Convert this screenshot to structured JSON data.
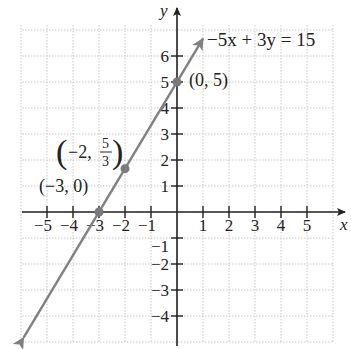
{
  "chart_data": {
    "type": "line",
    "title": "",
    "xlabel": "x",
    "ylabel": "y",
    "xlim": [
      -6,
      6
    ],
    "ylim": [
      -5,
      7
    ],
    "grid": true,
    "x_ticks": [
      -5,
      -4,
      -3,
      -2,
      -1,
      1,
      2,
      3,
      4,
      5
    ],
    "y_ticks": [
      -4,
      -3,
      -2,
      -1,
      1,
      2,
      3,
      4,
      5,
      6
    ],
    "x_tick_labels": [
      "−5",
      "−4",
      "−3",
      "−2",
      "−1",
      "1",
      "2",
      "3",
      "4",
      "5"
    ],
    "y_tick_labels": [
      "−4",
      "−3",
      "−2",
      "−1",
      "1",
      "2",
      "3",
      "4",
      "5",
      "6"
    ],
    "series": [
      {
        "name": "−5x + 3y = 15",
        "equation": "-5x + 3y = 15",
        "slope": 1.6667,
        "intercept": 5,
        "color": "#808080",
        "x": [
          -5.9,
          1.0
        ],
        "y": [
          -4.83,
          6.67
        ]
      }
    ],
    "points": [
      {
        "x": 0,
        "y": 5,
        "label": "(0, 5)"
      },
      {
        "x": -2,
        "y": 1.6667,
        "label": "(−2, 5/3)"
      },
      {
        "x": -3,
        "y": 0,
        "label": "(−3, 0)"
      }
    ],
    "annotations": [
      {
        "text": "−5x + 3y = 15",
        "position": "upper right of line"
      }
    ]
  },
  "labels": {
    "equation": "−5x + 3y = 15",
    "point_0_5": "(0, 5)",
    "point_neg2_prefix": "−2,",
    "point_neg2_num": "5",
    "point_neg2_den": "3",
    "point_neg3_0": "(−3, 0)",
    "x_axis_name": "x",
    "y_axis_name": "y"
  },
  "colors": {
    "line": "#808080",
    "axis": "#222222",
    "grid": "#c8c8c8",
    "point": "#7a7a7a"
  }
}
